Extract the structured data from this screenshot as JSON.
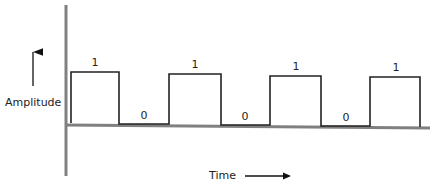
{
  "diagram": {
    "y_axis_label": "Amplitude",
    "x_axis_label": "Time",
    "colors": {
      "axis": "#808080",
      "signal": "#222222",
      "text": "#222222"
    },
    "bits": [
      {
        "value": "1",
        "level": "high"
      },
      {
        "value": "0",
        "level": "low"
      },
      {
        "value": "1",
        "level": "high"
      },
      {
        "value": "0",
        "level": "low"
      },
      {
        "value": "1",
        "level": "high"
      },
      {
        "value": "0",
        "level": "low"
      },
      {
        "value": "1",
        "level": "high"
      }
    ]
  }
}
